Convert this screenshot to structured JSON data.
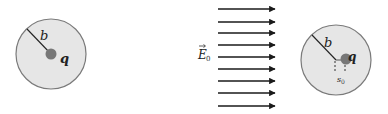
{
  "left_sphere": {
    "radius_label": "b",
    "charge_label": "q",
    "fill": "#e6e6e6",
    "stroke": "#7a7a7a",
    "charge_color": "#777777"
  },
  "field": {
    "label": "E",
    "subscript": "0",
    "arrow_count": 9,
    "arrow_color": "#1a1a1a"
  },
  "right_sphere": {
    "radius_label": "b",
    "charge_label": "q",
    "offset_label": "s",
    "offset_subscript": "0",
    "fill": "#e6e6e6",
    "stroke": "#7a7a7a",
    "charge_color": "#777777"
  }
}
